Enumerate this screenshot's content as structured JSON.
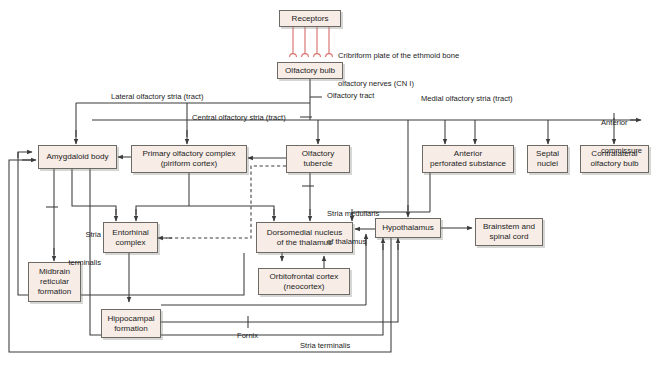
{
  "style": {
    "box_fill": "#f7ece6",
    "box_border": "#6d6a66",
    "wire_color": "#3a3a3a",
    "nerve_color": "#d9736e",
    "text_color": "#1c1c1c",
    "background": "#ffffff"
  },
  "nodes": [
    {
      "id": "receptors",
      "label": "Receptors",
      "x": 279,
      "y": 10,
      "w": 62,
      "h": 17
    },
    {
      "id": "olfactory-bulb",
      "label": "Olfactory bulb",
      "x": 277,
      "y": 62,
      "w": 66,
      "h": 17
    },
    {
      "id": "amygdaloid-body",
      "label": "Amygdaloid body",
      "x": 38,
      "y": 145,
      "w": 79,
      "h": 24
    },
    {
      "id": "primary-olfactory-complex",
      "label_line1": "Primary olfactory complex",
      "label_line2": "(piriform cortex)",
      "x": 131,
      "y": 145,
      "w": 116,
      "h": 28
    },
    {
      "id": "olfactory-tubercle",
      "label_line1": "Olfactory",
      "label_line2": "tubercle",
      "x": 286,
      "y": 145,
      "w": 64,
      "h": 28
    },
    {
      "id": "anterior-perforated-substance",
      "label_line1": "Anterior",
      "label_line2": "perforated substance",
      "x": 422,
      "y": 145,
      "w": 92,
      "h": 28
    },
    {
      "id": "septal-nuclei",
      "label_line1": "Septal",
      "label_line2": "nuclei",
      "x": 527,
      "y": 145,
      "w": 41,
      "h": 28
    },
    {
      "id": "contralateral-olfactory-bulb",
      "label_line1": "Contralateral",
      "label_line2": "olfactory bulb",
      "x": 580,
      "y": 145,
      "w": 69,
      "h": 28
    },
    {
      "id": "entorhinal-complex",
      "label_line1": "Entorhinal",
      "label_line2": "complex",
      "x": 103,
      "y": 222,
      "w": 55,
      "h": 31
    },
    {
      "id": "dorsomedial-nucleus",
      "label_line1": "Dorsomedial nucleus",
      "label_line2": "of the thalamus",
      "x": 256,
      "y": 222,
      "w": 97,
      "h": 31
    },
    {
      "id": "hypothalamus",
      "label": "Hypothalamus",
      "x": 375,
      "y": 218,
      "w": 66,
      "h": 20
    },
    {
      "id": "brainstem-spinal-cord",
      "label_line1": "Brainstem and",
      "label_line2": "spinal cord",
      "x": 475,
      "y": 218,
      "w": 68,
      "h": 28
    },
    {
      "id": "midbrain-reticular-formation",
      "label_line1": "Midbrain",
      "label_line2": "reticular",
      "label_line3": "formation",
      "x": 28,
      "y": 262,
      "w": 53,
      "h": 40
    },
    {
      "id": "orbitofrontal-cortex",
      "label_line1": "Orbitofrontal cortex",
      "label_line2": "(neocortex)",
      "x": 258,
      "y": 268,
      "w": 92,
      "h": 27
    },
    {
      "id": "hippocampal-formation",
      "label_line1": "Hippocampal",
      "label_line2": "formation",
      "x": 101,
      "y": 309,
      "w": 60,
      "h": 29
    }
  ],
  "edge_labels": [
    {
      "id": "cribriform-note",
      "text_line1": "Cribriform plate of the ethmoid bone",
      "text_line2": "olfactory nerves (CN I)",
      "x": 338,
      "y": 32
    },
    {
      "id": "olfactory-tract",
      "text": "Olfactory tract",
      "x": 327,
      "y": 91
    },
    {
      "id": "lateral-olfactory-stria",
      "text": "Lateral olfactory stria (tract)",
      "x": 111,
      "y": 92
    },
    {
      "id": "central-olfactory-stria",
      "text": "Central olfactory stria (tract)",
      "x": 192,
      "y": 113
    },
    {
      "id": "medial-olfactory-stria",
      "text": "Medial olfactory stria (tract)",
      "x": 421,
      "y": 94
    },
    {
      "id": "anterior-commissure",
      "text_line1": "Anterior",
      "text_line2": "commissure",
      "x": 601,
      "y": 99
    },
    {
      "id": "stria-medullaris",
      "text_line1": "Stria medullaris",
      "text_line2": "of thalamus",
      "x": 327,
      "y": 190
    },
    {
      "id": "stria-terminalis-upper",
      "text_line1": "Stria",
      "text_line2": "terminalis",
      "x": 57,
      "y": 211
    },
    {
      "id": "fornix",
      "text": "Fornix",
      "x": 242,
      "y": 331
    },
    {
      "id": "stria-terminalis-lower",
      "text": "Stria terminalis",
      "x": 300,
      "y": 341
    }
  ],
  "nerve_fibers": {
    "count": 4,
    "x_positions": [
      293,
      305,
      317,
      329
    ],
    "top_y": 27,
    "bottom_y": 56,
    "glomerulus_radius": 3.2
  }
}
